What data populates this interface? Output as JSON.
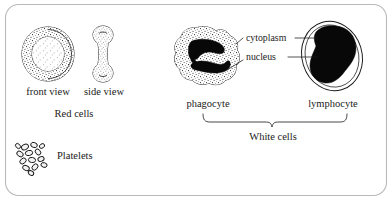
{
  "figure": {
    "border_color": "#b9b9b9",
    "ink_color": "#1a1a1a",
    "background": "#ffffff"
  },
  "labels": {
    "front_view": "front view",
    "side_view": "side view",
    "red_cells": "Red cells",
    "platelets": "Platelets",
    "phagocyte": "phagocyte",
    "lymphocyte": "lymphocyte",
    "cytoplasm": "cytoplasm",
    "nucleus": "nucleus",
    "white_cells": "White cells"
  },
  "icons": {
    "red_cell_front": "red-blood-cell-front-view-icon",
    "red_cell_side": "red-blood-cell-side-view-icon",
    "platelet_cluster": "platelet-cluster-icon",
    "phagocyte_cell": "phagocyte-cell-icon",
    "lymphocyte_cell": "lymphocyte-cell-icon",
    "brace": "curly-brace-icon"
  },
  "groups": [
    {
      "name": "Red cells",
      "members": [
        "front view",
        "side view"
      ]
    },
    {
      "name": "White cells",
      "members": [
        "phagocyte",
        "lymphocyte"
      ]
    },
    {
      "name": "Platelets",
      "members": [
        "Platelets"
      ]
    }
  ],
  "callouts": [
    {
      "label": "cytoplasm",
      "points_to": [
        "phagocyte",
        "lymphocyte"
      ]
    },
    {
      "label": "nucleus",
      "points_to": [
        "phagocyte",
        "lymphocyte"
      ]
    }
  ]
}
